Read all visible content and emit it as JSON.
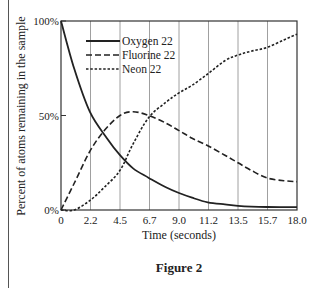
{
  "chart_data": {
    "type": "line",
    "title": "",
    "caption": "Figure 2",
    "xlabel": "Time (seconds)",
    "ylabel": "Percent of atoms remaining in the sample",
    "xlim": [
      0,
      18
    ],
    "ylim": [
      0,
      100
    ],
    "x_ticks": [
      "0",
      "2.2",
      "4.5",
      "6.7",
      "9.0",
      "11.2",
      "13.5",
      "15.7",
      "18.0"
    ],
    "x_tick_values": [
      0,
      2.25,
      4.5,
      6.75,
      9.0,
      11.25,
      13.5,
      15.75,
      18.0
    ],
    "y_ticks": [
      "0%",
      "50%",
      "100%"
    ],
    "y_tick_values": [
      0,
      50,
      100
    ],
    "grid": "vertical",
    "legend_position": "upper-left",
    "series": [
      {
        "name": "Oxygen 22",
        "style": "solid",
        "x": [
          0,
          1,
          2.2,
          3.5,
          4.5,
          5.5,
          6.7,
          8,
          9.0,
          10,
          11.2,
          12.5,
          13.5,
          15.7,
          18.0
        ],
        "values": [
          100,
          75,
          52,
          38,
          29,
          22,
          17,
          12,
          9,
          6.5,
          4,
          3,
          2.2,
          1.6,
          1.5
        ]
      },
      {
        "name": "Fluorine 22",
        "style": "dashed",
        "x": [
          0,
          1,
          2.2,
          3.3,
          4.5,
          5.5,
          6.7,
          8,
          9.0,
          10,
          11.2,
          12.5,
          13.5,
          14.5,
          15.7,
          17,
          18.0
        ],
        "values": [
          0,
          14,
          31,
          42,
          50,
          52,
          50,
          46,
          42,
          38,
          34,
          29,
          25,
          21,
          17,
          15.5,
          15
        ]
      },
      {
        "name": "Neon 22",
        "style": "dotted",
        "x": [
          0,
          1,
          2.2,
          3.3,
          4.5,
          5.5,
          6.7,
          8,
          9.0,
          10,
          11.2,
          12.5,
          13.5,
          14.5,
          15.7,
          17,
          18.0
        ],
        "values": [
          0,
          0,
          5,
          12,
          21,
          35,
          49,
          57,
          62,
          66,
          72,
          79,
          82,
          84,
          86,
          90,
          93
        ]
      }
    ]
  },
  "labels": {
    "xlabel": "Time (seconds)",
    "ylabel": "Percent of atoms remaining in the sample",
    "caption": "Figure 2"
  }
}
